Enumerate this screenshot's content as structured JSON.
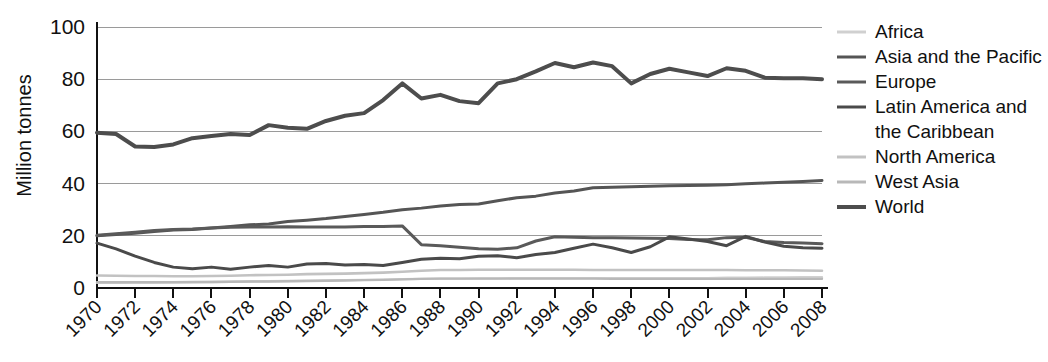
{
  "chart_data": {
    "type": "line",
    "title": "",
    "xlabel": "",
    "ylabel": "Million tonnes",
    "ylim": [
      0,
      100
    ],
    "yticks": [
      0,
      20,
      40,
      60,
      80,
      100
    ],
    "xlim": [
      1970,
      2008
    ],
    "grid": true,
    "legend_position": "right",
    "x": [
      1970,
      1971,
      1972,
      1973,
      1974,
      1975,
      1976,
      1977,
      1978,
      1979,
      1980,
      1981,
      1982,
      1983,
      1984,
      1985,
      1986,
      1987,
      1988,
      1989,
      1990,
      1991,
      1992,
      1993,
      1994,
      1995,
      1996,
      1997,
      1998,
      1999,
      2000,
      2001,
      2002,
      2003,
      2004,
      2005,
      2006,
      2007,
      2008
    ],
    "xtick_labels": [
      "1970",
      "1972",
      "1974",
      "1976",
      "1978",
      "1980",
      "1982",
      "1984",
      "1986",
      "1988",
      "1990",
      "1992",
      "1994",
      "1996",
      "1998",
      "2000",
      "2002",
      "2004",
      "2006",
      "2008"
    ],
    "series": [
      {
        "name": "Africa",
        "color": "#d0d0d0",
        "width": 2.4,
        "values": [
          2.0,
          2.0,
          2.1,
          2.1,
          2.2,
          2.2,
          2.3,
          2.4,
          2.5,
          2.6,
          2.7,
          2.8,
          2.9,
          3.0,
          3.1,
          3.2,
          3.4,
          3.5,
          3.6,
          3.6,
          3.7,
          3.7,
          3.8,
          3.8,
          3.8,
          3.8,
          3.8,
          3.8,
          3.8,
          3.8,
          3.8,
          3.8,
          3.8,
          3.9,
          3.9,
          4.0,
          4.0,
          4.1,
          4.1
        ]
      },
      {
        "name": "Asia and the Pacific",
        "color": "#555555",
        "width": 3.0,
        "values": [
          20.0,
          20.5,
          21.0,
          21.6,
          22.2,
          22.4,
          23.0,
          23.6,
          24.2,
          24.5,
          25.5,
          26.0,
          26.6,
          27.4,
          28.2,
          29.0,
          30.0,
          30.6,
          31.4,
          32.0,
          32.2,
          33.4,
          34.6,
          35.2,
          36.4,
          37.2,
          38.4,
          38.6,
          38.8,
          39.0,
          39.2,
          39.3,
          39.4,
          39.6,
          39.9,
          40.2,
          40.5,
          40.8,
          41.2
        ]
      },
      {
        "name": "Europe",
        "color": "#5a5a5a",
        "width": 3.0,
        "values": [
          20.2,
          20.8,
          21.4,
          22.0,
          22.4,
          22.6,
          23.0,
          23.3,
          23.4,
          23.4,
          23.5,
          23.4,
          23.4,
          23.4,
          23.6,
          23.6,
          23.8,
          16.6,
          16.2,
          15.6,
          15.0,
          14.8,
          15.4,
          18.0,
          19.6,
          19.4,
          19.3,
          19.3,
          19.2,
          19.1,
          19.0,
          18.6,
          18.5,
          19.3,
          19.4,
          17.8,
          17.4,
          17.2,
          17.0
        ]
      },
      {
        "name": "Latin America and the Caribbean",
        "color": "#4a4a4a",
        "width": 3.0,
        "values": [
          17.2,
          15.0,
          12.2,
          9.8,
          8.0,
          7.4,
          8.0,
          7.2,
          8.0,
          8.6,
          8.0,
          9.2,
          9.4,
          8.8,
          9.0,
          8.6,
          9.8,
          11.0,
          11.4,
          11.2,
          12.2,
          12.4,
          11.6,
          12.8,
          13.6,
          15.2,
          16.8,
          15.4,
          13.6,
          15.8,
          19.6,
          18.8,
          17.8,
          16.2,
          19.8,
          17.6,
          16.0,
          15.4,
          15.2
        ]
      },
      {
        "name": "North America",
        "color": "#c2c2c2",
        "width": 2.6,
        "values": [
          4.8,
          4.7,
          4.6,
          4.6,
          4.5,
          4.5,
          4.6,
          4.7,
          4.9,
          5.0,
          5.1,
          5.3,
          5.4,
          5.5,
          5.7,
          5.9,
          6.2,
          6.6,
          6.9,
          6.9,
          7.0,
          7.0,
          7.0,
          7.0,
          7.0,
          7.0,
          6.9,
          6.9,
          6.9,
          6.9,
          6.9,
          6.9,
          6.9,
          6.9,
          6.8,
          6.8,
          6.8,
          6.7,
          6.6
        ]
      },
      {
        "name": "West Asia",
        "color": "#b8b8b8",
        "width": 2.4,
        "values": [
          2.2,
          2.2,
          2.2,
          2.2,
          2.2,
          2.3,
          2.3,
          2.4,
          2.5,
          2.5,
          2.6,
          2.7,
          2.8,
          2.9,
          3.0,
          3.1,
          3.3,
          3.5,
          3.6,
          3.6,
          3.6,
          3.6,
          3.6,
          3.6,
          3.6,
          3.6,
          3.6,
          3.5,
          3.5,
          3.5,
          3.5,
          3.5,
          3.5,
          3.5,
          3.5,
          3.5,
          3.5,
          3.5,
          3.5
        ]
      },
      {
        "name": "World",
        "color": "#4d4d4d",
        "width": 4.0,
        "values": [
          59.5,
          59.0,
          54.2,
          54.0,
          55.0,
          57.4,
          58.2,
          59.0,
          58.6,
          62.4,
          61.4,
          61.0,
          64.0,
          66.0,
          67.0,
          72.0,
          78.4,
          72.6,
          74.0,
          71.6,
          70.8,
          78.4,
          80.0,
          83.0,
          86.2,
          84.6,
          86.4,
          85.0,
          78.4,
          82.0,
          84.0,
          82.6,
          81.2,
          84.2,
          83.2,
          80.6,
          80.4,
          80.4,
          80.0
        ]
      }
    ]
  },
  "legend": {
    "entries": [
      {
        "label": "Africa"
      },
      {
        "label": "Asia and the Pacific"
      },
      {
        "label": "Europe"
      },
      {
        "label": "Latin America and"
      },
      {
        "label": "the Caribbean"
      },
      {
        "label": "North America"
      },
      {
        "label": "West Asia"
      },
      {
        "label": "World"
      }
    ]
  }
}
